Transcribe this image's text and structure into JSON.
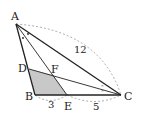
{
  "diagram": {
    "type": "triangle-geometry",
    "points": {
      "A": {
        "label": "A",
        "x": 16,
        "y": 24
      },
      "B": {
        "label": "B",
        "x": 35,
        "y": 95
      },
      "C": {
        "label": "C",
        "x": 121,
        "y": 95
      },
      "D": {
        "label": "D",
        "x": 29,
        "y": 69
      },
      "E": {
        "label": "E",
        "x": 67,
        "y": 95
      },
      "F": {
        "label": "F",
        "x": 53,
        "y": 75
      }
    },
    "measurements": {
      "AC": "12",
      "BE": "3",
      "EC": "5"
    },
    "shaded_region": "DBEF",
    "angle_marks": {
      "A": "dot (bisector of angle A)",
      "C": "x (bisector of angle C)"
    },
    "colors": {
      "line": "#222222",
      "shade": "#c8c8c8",
      "dashed": "#888888"
    }
  }
}
